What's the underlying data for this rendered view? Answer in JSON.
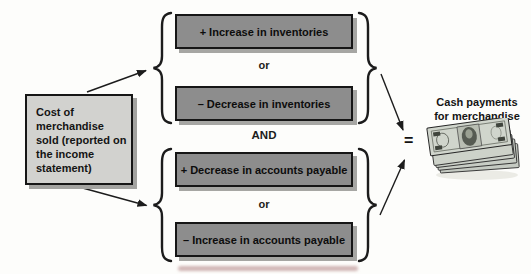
{
  "diagram": {
    "source_box": {
      "label": "Cost of merchandise sold (reported on the income statement)"
    },
    "inventory_group": {
      "increase_box": "+ Increase in inventories",
      "or_label": "or",
      "decrease_box": "– Decrease in inventories"
    },
    "and_label": "AND",
    "payables_group": {
      "decrease_box": "+ Decrease in accounts payable",
      "or_label": "or",
      "increase_box": "– Increase in accounts payable"
    },
    "result": {
      "equals_sign": "=",
      "label_line1": "Cash payments",
      "label_line2": "for merchandise",
      "icon": "cash-stack-icon"
    },
    "colors": {
      "background": "#fdfdfb",
      "box_fill_dark": "#8d8d8d",
      "box_fill_light": "#d2d2cf",
      "box_border": "#161616",
      "box_shadow": "#a3a3a0",
      "line": "#1c1c1c",
      "text": "#111111"
    }
  }
}
